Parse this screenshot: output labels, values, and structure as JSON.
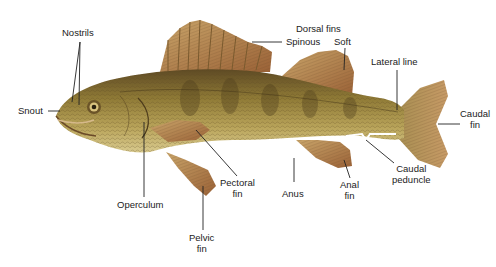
{
  "diagram": {
    "labels": {
      "nostrils": "Nostrils",
      "snout": "Snout",
      "dorsal_fins": "Dorsal fins",
      "spinous": "Spinous",
      "soft": "Soft",
      "lateral_line": "Lateral line",
      "caudal_fin_1": "Caudal",
      "caudal_fin_2": "fin",
      "caudal_peduncle_1": "Caudal",
      "caudal_peduncle_2": "peduncle",
      "anal_fin_1": "Anal",
      "anal_fin_2": "fin",
      "anus": "Anus",
      "pectoral_fin_1": "Pectoral",
      "pectoral_fin_2": "fin",
      "operculum": "Operculum",
      "pelvic_fin_1": "Pelvic",
      "pelvic_fin_2": "fin"
    },
    "colors": {
      "background": "#ffffff",
      "body": "#a8913f",
      "body_dark": "#6b5628",
      "belly": "#d9c98a",
      "fin": "#b88a52",
      "fin_dark": "#8a5a34",
      "leader_line": "#222222"
    }
  }
}
